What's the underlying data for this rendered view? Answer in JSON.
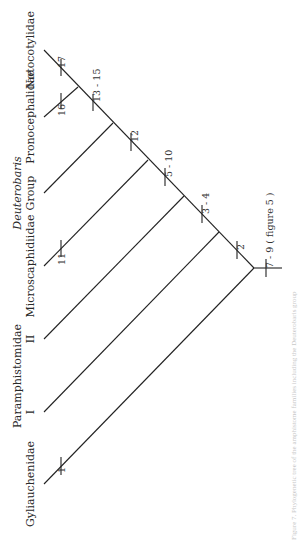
{
  "figure": {
    "orientation": "rotated-90-ccw",
    "caption": "Figure 7. Phylogenetic tree of the amphistome families including the Deuterobaris group",
    "root_character": "7 - 9 ( figure 5 )"
  },
  "taxa": [
    {
      "label": "Notocotylidae",
      "line2": "",
      "italic": false
    },
    {
      "label": "Pronocephalidae",
      "line2": "",
      "italic": false
    },
    {
      "label": "Deuterobaris",
      "line2": "Group",
      "italic": true
    },
    {
      "label": "Microscaphidiidae",
      "line2": "",
      "italic": false
    },
    {
      "label": "Paramphistomidae",
      "line2": "II",
      "italic": false
    },
    {
      "label": "Paramphistomidae",
      "line2": "I",
      "italic": false
    },
    {
      "label": "Gyliauchenidae",
      "line2": "",
      "italic": false
    }
  ],
  "characters": {
    "c1": "1",
    "c2": "2",
    "c3_4": "3 - 4",
    "c5_10": "5 - 10",
    "c11": "11",
    "c12": "12",
    "c13_15": "13 - 15",
    "c16": "16",
    "c17": "17",
    "c7_9": "7 - 9 ( figure 5 )"
  },
  "tree": {
    "newick": "(Gyliauchenidae,(Paramphistomidae_I,(Paramphistomidae_II,(Microscaphidiidae,(Deuterobaris_Group,(Pronocephalidae,Notocotylidae))))))"
  }
}
